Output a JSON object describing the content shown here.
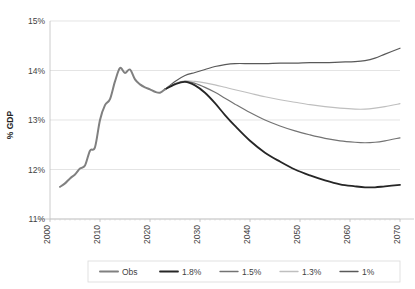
{
  "chart_data": {
    "type": "line",
    "title": "",
    "xlabel": "",
    "ylabel": "% GDP",
    "xlim": [
      2000,
      2070
    ],
    "ylim": [
      11,
      15
    ],
    "grid": true,
    "legend_position": "bottom",
    "x_ticks": [
      "2000",
      "2010",
      "2020",
      "2030",
      "2040",
      "2050",
      "2060",
      "2070"
    ],
    "y_ticks": [
      "11%",
      "12%",
      "13%",
      "14%",
      "15%"
    ],
    "series": [
      {
        "name": "Obs",
        "color": "#808080",
        "width": 2.0,
        "x": [
          2002,
          2003,
          2004,
          2005,
          2006,
          2007,
          2008,
          2009,
          2010,
          2011,
          2012,
          2013,
          2014,
          2015,
          2016,
          2017,
          2018,
          2019,
          2020,
          2021,
          2022,
          2023
        ],
        "values": [
          11.65,
          11.72,
          11.82,
          11.9,
          12.02,
          12.08,
          12.38,
          12.45,
          13.0,
          13.3,
          13.42,
          13.78,
          14.05,
          13.95,
          14.02,
          13.82,
          13.72,
          13.66,
          13.62,
          13.57,
          13.55,
          13.62
        ]
      },
      {
        "name": "1.8%",
        "color": "#262626",
        "width": 1.8,
        "x": [
          2023,
          2025,
          2027,
          2029,
          2031,
          2033,
          2035,
          2037,
          2040,
          2043,
          2046,
          2049,
          2052,
          2055,
          2058,
          2061,
          2063,
          2065,
          2067,
          2070
        ],
        "values": [
          13.62,
          13.72,
          13.77,
          13.7,
          13.55,
          13.34,
          13.1,
          12.88,
          12.58,
          12.34,
          12.16,
          12.0,
          11.88,
          11.78,
          11.7,
          11.66,
          11.64,
          11.64,
          11.66,
          11.69
        ]
      },
      {
        "name": "1.5%",
        "color": "#737373",
        "width": 1.2,
        "x": [
          2023,
          2025,
          2027,
          2029,
          2031,
          2033,
          2035,
          2037,
          2040,
          2043,
          2046,
          2049,
          2052,
          2055,
          2058,
          2061,
          2063,
          2065,
          2067,
          2070
        ],
        "values": [
          13.62,
          13.73,
          13.78,
          13.74,
          13.66,
          13.56,
          13.44,
          13.32,
          13.15,
          13.0,
          12.88,
          12.78,
          12.7,
          12.63,
          12.58,
          12.55,
          12.54,
          12.55,
          12.58,
          12.64
        ]
      },
      {
        "name": "1.3%",
        "color": "#bfbfbf",
        "width": 1.1,
        "x": [
          2023,
          2025,
          2027,
          2029,
          2031,
          2033,
          2035,
          2037,
          2040,
          2043,
          2046,
          2049,
          2052,
          2055,
          2058,
          2061,
          2063,
          2065,
          2067,
          2070
        ],
        "values": [
          13.62,
          13.74,
          13.79,
          13.78,
          13.75,
          13.71,
          13.66,
          13.61,
          13.54,
          13.47,
          13.41,
          13.36,
          13.31,
          13.27,
          13.24,
          13.22,
          13.22,
          13.24,
          13.27,
          13.33
        ]
      },
      {
        "name": "1%",
        "color": "#595959",
        "width": 1.2,
        "x": [
          2023,
          2025,
          2027,
          2029,
          2031,
          2033,
          2035,
          2037,
          2040,
          2043,
          2046,
          2049,
          2052,
          2055,
          2058,
          2061,
          2063,
          2065,
          2067,
          2070
        ],
        "values": [
          13.62,
          13.78,
          13.9,
          13.96,
          14.02,
          14.08,
          14.12,
          14.14,
          14.14,
          14.14,
          14.15,
          14.15,
          14.16,
          14.16,
          14.17,
          14.18,
          14.2,
          14.25,
          14.33,
          14.45
        ]
      }
    ]
  },
  "legend": {
    "items": [
      {
        "label": "Obs"
      },
      {
        "label": "1.8%"
      },
      {
        "label": "1.5%"
      },
      {
        "label": "1.3%"
      },
      {
        "label": "1%"
      }
    ]
  }
}
